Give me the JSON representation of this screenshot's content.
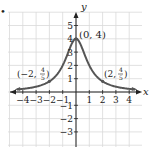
{
  "marker": "•",
  "chart_data": {
    "type": "line",
    "title": "",
    "xlabel": "x",
    "ylabel": "y",
    "xlim": [
      -4.5,
      4.8
    ],
    "ylim": [
      -3.8,
      6.0
    ],
    "grid": true,
    "x_ticks": [
      -4,
      -3,
      -2,
      -1,
      1,
      2,
      3,
      4
    ],
    "x_tick_labels": [
      "−4",
      "−3",
      "−2",
      "−1",
      "1",
      "2",
      "3",
      "4"
    ],
    "y_ticks": [
      5,
      4,
      3,
      2,
      1,
      -1,
      -2,
      -3
    ],
    "y_tick_labels": [
      "5",
      "4",
      "3",
      "2",
      "1",
      "−1",
      "−2",
      "−3"
    ],
    "series": [
      {
        "name": "y = 4/(x^2+1)",
        "x": [
          -4.5,
          -4,
          -3,
          -2,
          -1.5,
          -1,
          -0.5,
          0,
          0.5,
          1,
          1.5,
          2,
          3,
          4,
          4.5
        ],
        "values": [
          0.19,
          0.24,
          0.4,
          0.8,
          1.23,
          2,
          3.2,
          4,
          3.2,
          2,
          1.23,
          0.8,
          0.4,
          0.24,
          0.19
        ]
      }
    ],
    "annotations": [
      {
        "text": "(0, 4)",
        "x": 0,
        "y": 4
      },
      {
        "text": "(−2, 4/5)",
        "x": -2,
        "y": 0.8
      },
      {
        "text": "(2, 4/5)",
        "x": 2,
        "y": 0.8
      }
    ],
    "labels": {
      "peak": "(0, 4)",
      "left_prefix": "(−2,",
      "right_prefix": "(2,",
      "frac_num": "4",
      "frac_den": "5",
      "close": ")"
    },
    "colors": {
      "curve": "#555555",
      "axis": "#222222",
      "grid": "#d9d9d9"
    }
  }
}
